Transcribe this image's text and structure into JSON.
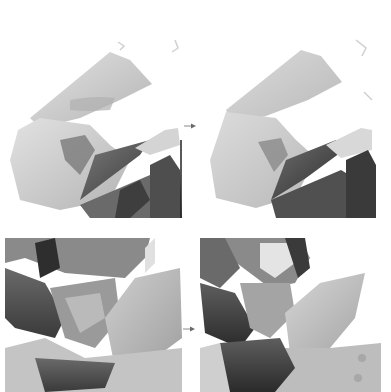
{
  "layout": {
    "rows": 2,
    "cols": 2,
    "description": "before-to-after comparison grid of grayscale watercolor illustration crops"
  },
  "colors": {
    "background": "#ffffff",
    "light_wash": "#d6d6d6",
    "mid_wash": "#a8a8a8",
    "dark_wash": "#5a5a5a",
    "darkest": "#2e2e2e",
    "arrow": "#8a8a8a"
  },
  "panels": [
    {
      "id": "top-left",
      "role": "before",
      "subject": "sleeve and draped cloth, hand reaching right"
    },
    {
      "id": "top-right",
      "role": "after",
      "subject": "sleeve and draped cloth, hand reaching right (refined)"
    },
    {
      "id": "bottom-left",
      "role": "before",
      "subject": "figure with layered petals/leaves and cloth folds"
    },
    {
      "id": "bottom-right",
      "role": "after",
      "subject": "figure with face and hair, layered petals/leaves (refined)"
    }
  ],
  "arrows": [
    {
      "id": "top-arrow",
      "icon": "arrow-right-icon"
    },
    {
      "id": "bottom-arrow",
      "icon": "arrow-right-icon"
    }
  ]
}
